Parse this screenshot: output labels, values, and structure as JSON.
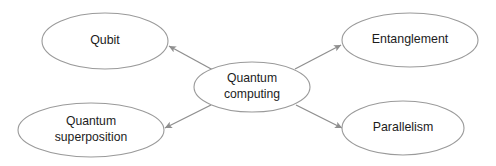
{
  "diagram": {
    "type": "concept-map",
    "background_color": "#ffffff",
    "stroke_color": "#9a9a9a",
    "edge_color": "#8f8f8f",
    "text_color": "#1c1c1c",
    "canvas": {
      "width": 496,
      "height": 166
    },
    "center_node": {
      "id": "quantum-computing",
      "lines": [
        "Quantum",
        "computing"
      ],
      "text": "Quantum computing",
      "cx": 252,
      "cy": 87,
      "rx": 58,
      "ry": 25
    },
    "nodes": [
      {
        "id": "qubit",
        "lines": [
          "Qubit"
        ],
        "text": "Qubit",
        "cx": 105,
        "cy": 41,
        "rx": 63,
        "ry": 28
      },
      {
        "id": "entanglement",
        "lines": [
          "Entanglement"
        ],
        "text": "Entanglement",
        "cx": 410,
        "cy": 40,
        "rx": 68,
        "ry": 27
      },
      {
        "id": "quantum-superposition",
        "lines": [
          "Quantum",
          "superposition"
        ],
        "text": "Quantum superposition",
        "cx": 91,
        "cy": 130,
        "rx": 73,
        "ry": 27
      },
      {
        "id": "parallelism",
        "lines": [
          "Parallelism"
        ],
        "text": "Parallelism",
        "cx": 403,
        "cy": 128,
        "rx": 61,
        "ry": 27
      }
    ],
    "edges": [
      {
        "id": "edge-to-qubit",
        "from": "quantum-computing",
        "to": "qubit",
        "x1": 213,
        "y1": 70,
        "x2": 169,
        "y2": 46,
        "arrow": "to"
      },
      {
        "id": "edge-to-entanglement",
        "from": "quantum-computing",
        "to": "entanglement",
        "x1": 295,
        "y1": 69,
        "x2": 341,
        "y2": 45,
        "arrow": "to"
      },
      {
        "id": "edge-to-quantum-superposition",
        "from": "quantum-computing",
        "to": "quantum-superposition",
        "x1": 211,
        "y1": 105,
        "x2": 165,
        "y2": 128,
        "arrow": "to"
      },
      {
        "id": "edge-to-parallelism",
        "from": "quantum-computing",
        "to": "parallelism",
        "x1": 296,
        "y1": 105,
        "x2": 342,
        "y2": 128,
        "arrow": "to"
      }
    ]
  }
}
